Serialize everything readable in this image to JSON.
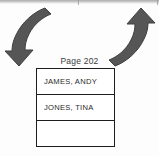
{
  "figure": {
    "caption": "Page 202",
    "arrows": [
      {
        "name": "left-curved-arrow",
        "direction": "down-left",
        "color": "#565656"
      },
      {
        "name": "right-curved-arrow",
        "direction": "up-left",
        "color": "#565656"
      }
    ],
    "table": {
      "rows": [
        {
          "label": "JAMES, ANDY"
        },
        {
          "label": "JONES, TINA"
        },
        {
          "label": ""
        }
      ]
    }
  },
  "colors": {
    "arrow_fill": "#565656",
    "arrow_stroke": "#3f3f3f",
    "table_border": "#1d1d1d",
    "text": "#2a2a2a",
    "background": "#ffffff"
  }
}
